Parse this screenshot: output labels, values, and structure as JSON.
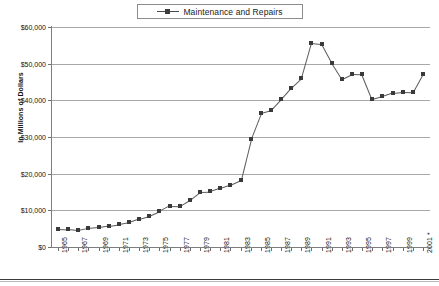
{
  "chart_data": {
    "type": "line",
    "title": "",
    "xlabel": "",
    "ylabel": "In Millions of Dollars",
    "legend": [
      "Maintenance and Repairs"
    ],
    "legend_position": "top-center",
    "grid": true,
    "ylim": [
      0,
      60000
    ],
    "ytick_labels": [
      "$60,000",
      "$50,000",
      "$40,000",
      "$30,000",
      "$20,000",
      "$10,000",
      "$0"
    ],
    "ytick_values": [
      60000,
      50000,
      40000,
      30000,
      20000,
      10000,
      0
    ],
    "xtick_labels": [
      "1965",
      "1967",
      "1969",
      "1971",
      "1973",
      "1975",
      "1977",
      "1979",
      "1981",
      "1983",
      "1985",
      "1987",
      "1989",
      "1991",
      "1993",
      "1995",
      "1997",
      "1999",
      "2001 *"
    ],
    "x": [
      1965,
      1966,
      1967,
      1968,
      1969,
      1970,
      1971,
      1972,
      1973,
      1974,
      1975,
      1976,
      1977,
      1978,
      1979,
      1980,
      1981,
      1982,
      1983,
      1984,
      1985,
      1986,
      1987,
      1988,
      1989,
      1990,
      1991,
      1992,
      1993,
      1994,
      1995,
      1996,
      1997,
      1998,
      1999,
      2000,
      2001
    ],
    "series": [
      {
        "name": "Maintenance and Repairs",
        "color": "#3a3a3a",
        "marker": "square",
        "values": [
          5000,
          4850,
          4550,
          5150,
          5450,
          5850,
          6250,
          6750,
          7750,
          8500,
          9750,
          11300,
          11250,
          12900,
          15100,
          15200,
          16100,
          17000,
          18200,
          29400,
          36500,
          37300,
          40300,
          43400,
          46000,
          55700,
          55400,
          50300,
          45900,
          47200,
          47100,
          40300,
          41100,
          42000,
          42300,
          42200,
          47200
        ]
      }
    ]
  },
  "legend": {
    "label": "Maintenance and Repairs"
  },
  "axes": {
    "y_title": "In Millions of Dollars"
  }
}
